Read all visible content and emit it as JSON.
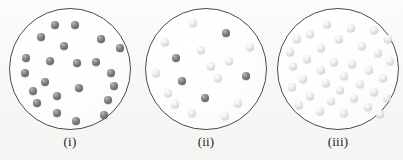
{
  "figure": {
    "background_color": "#f7f7f6",
    "circle_outline_color": "#4b4b4b",
    "dark_sphere_color": "#6e6e6e",
    "light_sphere_color": "#dedede",
    "panel_count": 3
  },
  "panels": [
    {
      "label": "(i)",
      "name": "container-i",
      "left": 9,
      "circle": {
        "x": 9,
        "y": 8,
        "diameter": 122
      },
      "sphere_count": 20,
      "dark_count": 20,
      "light_count": 0,
      "spheres": [
        {
          "x": 46,
          "y": 17,
          "r": 4.0,
          "shade": "dark"
        },
        {
          "x": 66,
          "y": 17,
          "r": 4.0,
          "shade": "dark"
        },
        {
          "x": 32,
          "y": 29,
          "r": 4.0,
          "shade": "dark"
        },
        {
          "x": 92,
          "y": 31,
          "r": 4.0,
          "shade": "dark"
        },
        {
          "x": 55,
          "y": 38,
          "r": 4.0,
          "shade": "dark"
        },
        {
          "x": 111,
          "y": 40,
          "r": 3.8,
          "shade": "dark"
        },
        {
          "x": 17,
          "y": 50,
          "r": 4.0,
          "shade": "dark"
        },
        {
          "x": 41,
          "y": 53,
          "r": 4.0,
          "shade": "dark"
        },
        {
          "x": 68,
          "y": 55,
          "r": 4.0,
          "shade": "dark"
        },
        {
          "x": 87,
          "y": 54,
          "r": 4.0,
          "shade": "dark"
        },
        {
          "x": 16,
          "y": 65,
          "r": 4.0,
          "shade": "dark"
        },
        {
          "x": 102,
          "y": 65,
          "r": 4.0,
          "shade": "dark"
        },
        {
          "x": 36,
          "y": 74,
          "r": 4.0,
          "shade": "dark"
        },
        {
          "x": 105,
          "y": 78,
          "r": 4.0,
          "shade": "dark"
        },
        {
          "x": 24,
          "y": 83,
          "r": 4.0,
          "shade": "dark"
        },
        {
          "x": 70,
          "y": 80,
          "r": 4.0,
          "shade": "dark"
        },
        {
          "x": 28,
          "y": 95,
          "r": 4.0,
          "shade": "dark"
        },
        {
          "x": 48,
          "y": 88,
          "r": 4.0,
          "shade": "dark"
        },
        {
          "x": 99,
          "y": 92,
          "r": 4.0,
          "shade": "dark"
        },
        {
          "x": 48,
          "y": 105,
          "r": 4.0,
          "shade": "dark"
        },
        {
          "x": 95,
          "y": 107,
          "r": 4.0,
          "shade": "dark"
        },
        {
          "x": 67,
          "y": 113,
          "r": 4.0,
          "shade": "dark"
        }
      ]
    },
    {
      "label": "(ii)",
      "name": "container-ii",
      "left": 145,
      "circle": {
        "x": 145,
        "y": 8,
        "diameter": 122
      },
      "sphere_count": 18,
      "dark_count": 7,
      "light_count": 11,
      "spheres": [
        {
          "x": 48,
          "y": 15,
          "r": 4.0,
          "shade": "light"
        },
        {
          "x": 81,
          "y": 25,
          "r": 4.0,
          "shade": "dark"
        },
        {
          "x": 20,
          "y": 34,
          "r": 4.0,
          "shade": "light"
        },
        {
          "x": 105,
          "y": 39,
          "r": 4.0,
          "shade": "light"
        },
        {
          "x": 56,
          "y": 42,
          "r": 4.0,
          "shade": "light"
        },
        {
          "x": 31,
          "y": 50,
          "r": 4.0,
          "shade": "dark"
        },
        {
          "x": 84,
          "y": 53,
          "r": 4.0,
          "shade": "light"
        },
        {
          "x": 11,
          "y": 65,
          "r": 4.0,
          "shade": "light"
        },
        {
          "x": 73,
          "y": 70,
          "r": 4.0,
          "shade": "light"
        },
        {
          "x": 101,
          "y": 68,
          "r": 4.0,
          "shade": "dark"
        },
        {
          "x": 37,
          "y": 73,
          "r": 4.0,
          "shade": "dark"
        },
        {
          "x": 23,
          "y": 85,
          "r": 4.0,
          "shade": "light"
        },
        {
          "x": 60,
          "y": 90,
          "r": 4.0,
          "shade": "dark"
        },
        {
          "x": 93,
          "y": 95,
          "r": 4.0,
          "shade": "light"
        },
        {
          "x": 47,
          "y": 105,
          "r": 4.0,
          "shade": "light"
        },
        {
          "x": 80,
          "y": 108,
          "r": 4.0,
          "shade": "light"
        },
        {
          "x": 30,
          "y": 96,
          "r": 3.6,
          "shade": "light"
        },
        {
          "x": 66,
          "y": 58,
          "r": 3.6,
          "shade": "light"
        }
      ]
    },
    {
      "label": "(iii)",
      "name": "container-iii",
      "left": 277,
      "circle": {
        "x": 277,
        "y": 8,
        "diameter": 122
      },
      "sphere_count": 35,
      "dark_count": 0,
      "light_count": 35,
      "spheres": [
        {
          "x": 50,
          "y": 16,
          "r": 3.8,
          "shade": "light"
        },
        {
          "x": 74,
          "y": 20,
          "r": 3.8,
          "shade": "light"
        },
        {
          "x": 97,
          "y": 22,
          "r": 3.8,
          "shade": "light"
        },
        {
          "x": 33,
          "y": 26,
          "r": 3.8,
          "shade": "light"
        },
        {
          "x": 62,
          "y": 31,
          "r": 3.8,
          "shade": "light"
        },
        {
          "x": 111,
          "y": 31,
          "r": 3.8,
          "shade": "light"
        },
        {
          "x": 20,
          "y": 31,
          "r": 3.8,
          "shade": "light"
        },
        {
          "x": 44,
          "y": 40,
          "r": 3.8,
          "shade": "light"
        },
        {
          "x": 85,
          "y": 38,
          "r": 3.8,
          "shade": "light"
        },
        {
          "x": 13,
          "y": 44,
          "r": 3.8,
          "shade": "light"
        },
        {
          "x": 101,
          "y": 45,
          "r": 3.8,
          "shade": "light"
        },
        {
          "x": 30,
          "y": 51,
          "r": 3.8,
          "shade": "light"
        },
        {
          "x": 57,
          "y": 54,
          "r": 3.8,
          "shade": "light"
        },
        {
          "x": 75,
          "y": 56,
          "r": 3.8,
          "shade": "light"
        },
        {
          "x": 113,
          "y": 53,
          "r": 3.8,
          "shade": "light"
        },
        {
          "x": 16,
          "y": 58,
          "r": 3.8,
          "shade": "light"
        },
        {
          "x": 44,
          "y": 62,
          "r": 3.8,
          "shade": "light"
        },
        {
          "x": 92,
          "y": 62,
          "r": 3.8,
          "shade": "light"
        },
        {
          "x": 67,
          "y": 68,
          "r": 3.8,
          "shade": "light"
        },
        {
          "x": 26,
          "y": 71,
          "r": 3.8,
          "shade": "light"
        },
        {
          "x": 106,
          "y": 70,
          "r": 3.8,
          "shade": "light"
        },
        {
          "x": 49,
          "y": 75,
          "r": 3.8,
          "shade": "light"
        },
        {
          "x": 83,
          "y": 76,
          "r": 3.8,
          "shade": "light"
        },
        {
          "x": 15,
          "y": 79,
          "r": 3.8,
          "shade": "light"
        },
        {
          "x": 63,
          "y": 82,
          "r": 3.8,
          "shade": "light"
        },
        {
          "x": 97,
          "y": 84,
          "r": 3.8,
          "shade": "light"
        },
        {
          "x": 33,
          "y": 88,
          "r": 3.8,
          "shade": "light"
        },
        {
          "x": 77,
          "y": 90,
          "r": 3.8,
          "shade": "light"
        },
        {
          "x": 54,
          "y": 93,
          "r": 3.8,
          "shade": "light"
        },
        {
          "x": 110,
          "y": 90,
          "r": 3.8,
          "shade": "light"
        },
        {
          "x": 22,
          "y": 97,
          "r": 3.8,
          "shade": "light"
        },
        {
          "x": 91,
          "y": 99,
          "r": 3.8,
          "shade": "light"
        },
        {
          "x": 43,
          "y": 103,
          "r": 3.8,
          "shade": "light"
        },
        {
          "x": 67,
          "y": 105,
          "r": 3.8,
          "shade": "light"
        },
        {
          "x": 103,
          "y": 106,
          "r": 3.8,
          "shade": "light"
        }
      ]
    }
  ]
}
